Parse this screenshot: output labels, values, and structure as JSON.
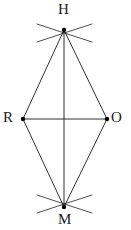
{
  "figure": {
    "type": "geometric-construction",
    "shape": "rhombus",
    "name": "RHOM",
    "canvas": {
      "width": 131,
      "height": 230
    },
    "colors": {
      "background": "#ffffff",
      "stroke": "#1a1a1a",
      "arc_stroke": "#3a3a3a",
      "label_color": "#1a1a1a",
      "vertex_dot": "#000000"
    },
    "vertices": [
      {
        "id": "H",
        "label": "H",
        "x": 64,
        "y": 30,
        "label_x": 58,
        "label_y": 2,
        "position": "top"
      },
      {
        "id": "R",
        "label": "R",
        "x": 23,
        "y": 119,
        "label_x": 3,
        "label_y": 110,
        "position": "left"
      },
      {
        "id": "O",
        "label": "O",
        "x": 107,
        "y": 119,
        "label_x": 111,
        "label_y": 110,
        "position": "right"
      },
      {
        "id": "M",
        "label": "M",
        "x": 64,
        "y": 207,
        "label_x": 58,
        "label_y": 212,
        "position": "bottom"
      }
    ],
    "sides": [
      {
        "id": "RH",
        "from": "R",
        "to": "H",
        "x1": 23,
        "y1": 119,
        "x2": 64,
        "y2": 30
      },
      {
        "id": "HO",
        "from": "H",
        "to": "O",
        "x1": 64,
        "y1": 30,
        "x2": 107,
        "y2": 119
      },
      {
        "id": "OM",
        "from": "O",
        "to": "M",
        "x1": 107,
        "y1": 119,
        "x2": 64,
        "y2": 207
      },
      {
        "id": "MR",
        "from": "M",
        "to": "R",
        "x1": 64,
        "y1": 207,
        "x2": 23,
        "y2": 119
      }
    ],
    "diagonals": [
      {
        "id": "RO",
        "from": "R",
        "to": "O",
        "x1": 23,
        "y1": 119,
        "x2": 107,
        "y2": 119,
        "orientation": "horizontal"
      },
      {
        "id": "HM",
        "from": "H",
        "to": "M",
        "x1": 64,
        "y1": 30,
        "x2": 64,
        "y2": 207,
        "orientation": "vertical"
      }
    ],
    "construction_arcs": [
      {
        "id": "arc-top-from-left",
        "d": "M 37 24 Q 64 33 92 42",
        "through": "H"
      },
      {
        "id": "arc-top-from-right",
        "d": "M 92 24 Q 64 33 37 42",
        "through": "H"
      },
      {
        "id": "arc-bottom-from-left",
        "d": "M 37 213 Q 64 204 92 195",
        "through": "M"
      },
      {
        "id": "arc-bottom-from-right",
        "d": "M 92 213 Q 64 204 37 195",
        "through": "M"
      }
    ]
  }
}
